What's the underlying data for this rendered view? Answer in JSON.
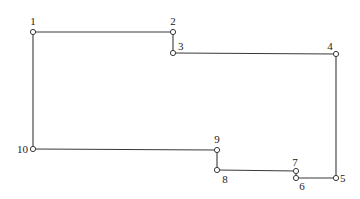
{
  "diagram": {
    "type": "polygon-outline",
    "nodes": [
      {
        "id": "1",
        "label": "1",
        "x": 33,
        "y": 32,
        "lx": 33,
        "ly": 25,
        "anchor": "middle"
      },
      {
        "id": "2",
        "label": "2",
        "x": 173,
        "y": 32,
        "lx": 173,
        "ly": 25,
        "anchor": "middle"
      },
      {
        "id": "3",
        "label": "3",
        "x": 173,
        "y": 53,
        "lx": 178,
        "ly": 50,
        "anchor": "start"
      },
      {
        "id": "4",
        "label": "4",
        "x": 336,
        "y": 54,
        "lx": 330,
        "ly": 50,
        "anchor": "middle"
      },
      {
        "id": "5",
        "label": "5",
        "x": 336,
        "y": 178,
        "lx": 340,
        "ly": 182,
        "anchor": "start"
      },
      {
        "id": "6",
        "label": "6",
        "x": 296,
        "y": 178,
        "lx": 302,
        "ly": 190,
        "anchor": "middle"
      },
      {
        "id": "7",
        "label": "7",
        "x": 296,
        "y": 171,
        "lx": 295,
        "ly": 166,
        "anchor": "middle"
      },
      {
        "id": "8",
        "label": "8",
        "x": 217,
        "y": 170,
        "lx": 225,
        "ly": 183,
        "anchor": "middle"
      },
      {
        "id": "9",
        "label": "9",
        "x": 217,
        "y": 150,
        "lx": 217,
        "ly": 143,
        "anchor": "middle"
      },
      {
        "id": "10",
        "label": "10",
        "x": 33,
        "y": 149,
        "lx": 28,
        "ly": 153,
        "anchor": "end"
      }
    ],
    "edges": [
      [
        "1",
        "2"
      ],
      [
        "2",
        "3"
      ],
      [
        "3",
        "4"
      ],
      [
        "4",
        "5"
      ],
      [
        "5",
        "6"
      ],
      [
        "6",
        "7"
      ],
      [
        "7",
        "8"
      ],
      [
        "8",
        "9"
      ],
      [
        "9",
        "10"
      ],
      [
        "10",
        "1"
      ]
    ],
    "colors": {
      "stroke": "#3a3a3a",
      "background": "#ffffff",
      "text": "#222222"
    }
  }
}
